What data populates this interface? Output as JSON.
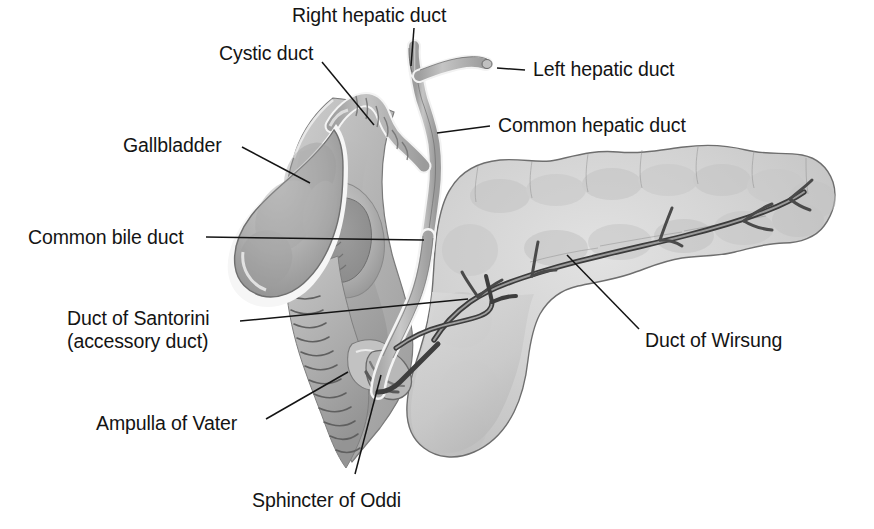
{
  "figure": {
    "background_color": "#ffffff",
    "ink_color": "#141414",
    "organ_fill_light": "#d8d8d8",
    "organ_fill_mid": "#b4b4b4",
    "organ_fill_dark": "#8e8e8e",
    "duct_highlight": "#f4f4f4"
  },
  "labels": {
    "right_hepatic_duct": "Right hepatic duct",
    "left_hepatic_duct": "Left hepatic duct",
    "common_hepatic_duct": "Common hepatic duct",
    "cystic_duct": "Cystic duct",
    "gallbladder": "Gallbladder",
    "common_bile_duct": "Common bile duct",
    "duct_of_santorini_line1": "Duct of Santorini",
    "duct_of_santorini_line2": "(accessory duct)",
    "ampulla_of_vater": "Ampulla of Vater",
    "sphincter_of_oddi": "Sphincter of Oddi",
    "duct_of_wirsung": "Duct of Wirsung"
  },
  "structures": [
    {
      "name": "liver-hepatic-ducts",
      "label": "Right hepatic duct"
    },
    {
      "name": "liver-hepatic-ducts",
      "label": "Left hepatic duct"
    },
    {
      "name": "common-hepatic-duct",
      "label": "Common hepatic duct"
    },
    {
      "name": "cystic-duct",
      "label": "Cystic duct"
    },
    {
      "name": "gallbladder",
      "label": "Gallbladder"
    },
    {
      "name": "common-bile-duct",
      "label": "Common bile duct"
    },
    {
      "name": "accessory-pancreatic-duct",
      "label": "Duct of Santorini"
    },
    {
      "name": "hepatopancreatic-ampulla",
      "label": "Ampulla of Vater"
    },
    {
      "name": "sphincter-of-oddi",
      "label": "Sphincter of Oddi"
    },
    {
      "name": "main-pancreatic-duct",
      "label": "Duct of Wirsung"
    },
    {
      "name": "duodenum",
      "label": ""
    },
    {
      "name": "pancreas",
      "label": ""
    }
  ]
}
